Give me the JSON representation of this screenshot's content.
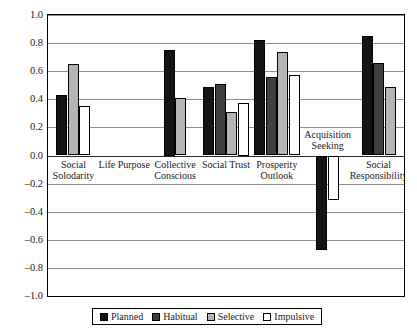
{
  "chart_data": {
    "type": "bar",
    "title": "",
    "xlabel": "",
    "ylabel": "Coefficients",
    "ylim": [
      -1.0,
      1.0
    ],
    "ytick_labels": [
      "1.0",
      "0.8",
      "0.6",
      "0.4",
      "0.2",
      "0.0",
      "-0.2",
      "-0.4",
      "-0.6",
      "-0.8",
      "-1.0"
    ],
    "ytick_values": [
      1.0,
      0.8,
      0.6,
      0.4,
      0.2,
      0.0,
      -0.2,
      -0.4,
      -0.6,
      -0.8,
      -1.0
    ],
    "grid": true,
    "legend_position": "bottom",
    "categories": [
      "Social Solodarity",
      "Life Purpose",
      "Collective Conscious",
      "Social Trust",
      "Prosperity Outlook",
      "Acquisition Seeking",
      "Social Responsibility"
    ],
    "series": [
      {
        "name": "Planned",
        "color": "#141414",
        "values": [
          0.43,
          null,
          0.75,
          0.49,
          0.82,
          -0.67,
          0.85
        ]
      },
      {
        "name": "Habitual",
        "color": "#3f3f3f",
        "values": [
          null,
          null,
          null,
          0.51,
          0.56,
          null,
          0.66
        ]
      },
      {
        "name": "Selective",
        "color": "#b4b4b4",
        "values": [
          0.65,
          null,
          0.41,
          0.31,
          0.74,
          null,
          0.49
        ]
      },
      {
        "name": "Impulsive",
        "color": "#ffffff",
        "values": [
          0.355,
          null,
          null,
          0.375,
          0.575,
          -0.32,
          null
        ]
      }
    ]
  },
  "legend": {
    "items": [
      {
        "label": "Planned",
        "key": "planned"
      },
      {
        "label": "Habitual",
        "key": "habitual"
      },
      {
        "label": "Selective",
        "key": "selective"
      },
      {
        "label": "Impulsive",
        "key": "impulsive"
      }
    ]
  }
}
